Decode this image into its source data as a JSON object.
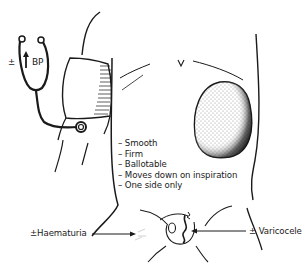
{
  "figure": {
    "labels": {
      "bp": "BP",
      "bp_prefix": "±",
      "haematuria": "±Haematuria",
      "varicocele": "± Varicocele"
    },
    "features": [
      "Smooth",
      "Firm",
      "Ballotable",
      "Moves down on inspiration",
      "One side only"
    ],
    "icons": {
      "stethoscope": "stethoscope-icon",
      "bp_arrow": "up-arrow-icon"
    },
    "colors": {
      "ink": "#1a1a1a",
      "background": "#ffffff"
    }
  }
}
